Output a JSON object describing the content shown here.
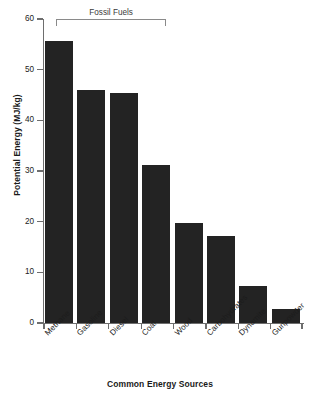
{
  "chart_data": {
    "type": "bar",
    "title": "",
    "xlabel": "Common Energy Sources",
    "ylabel": "Potential Energy (MJ/kg)",
    "categories": [
      "Methane",
      "Gasoline",
      "Diesel",
      "Coal",
      "Wood",
      "Carbohydrates",
      "Dynamite",
      "Gunpowder"
    ],
    "values": [
      55.6,
      46.0,
      45.4,
      31.2,
      19.8,
      17.1,
      7.3,
      2.8
    ],
    "ylim": [
      0,
      60
    ],
    "ytick_labels": [
      "0",
      "10",
      "20",
      "30",
      "40",
      "50",
      "60"
    ],
    "ytick_values": [
      0,
      10,
      20,
      30,
      40,
      50,
      60
    ],
    "grid": false,
    "legend": false,
    "bar_color": "#232323",
    "axis_color": "#6e6e6e",
    "annotations": [
      {
        "label": "Fossil Fuels",
        "type": "bracket",
        "spans_categories": [
          "Methane",
          "Gasoline",
          "Diesel",
          "Coal"
        ]
      }
    ]
  }
}
